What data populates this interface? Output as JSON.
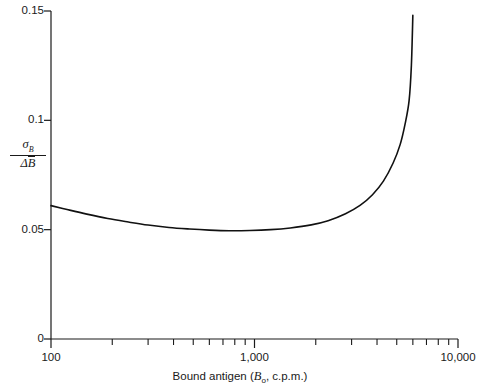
{
  "chart_data": {
    "type": "line",
    "title": "",
    "subtitle": "",
    "xlabel_plain": "Bound antigen (B0, c.p.m.)",
    "xlabel_main": "Bound antigen (",
    "xlabel_italic": "B",
    "xlabel_sub": "o",
    "xlabel_tail": ", c.p.m.)",
    "ylabel_plain": "sigma_B / delta B-bar",
    "ylabel_numerator_symbol": "σ",
    "ylabel_numerator_sub": "B",
    "ylabel_denominator_symbol": "Δ",
    "ylabel_denominator_var": "B",
    "xscale": "log",
    "yscale": "linear",
    "xlim": [
      100,
      10000
    ],
    "ylim": [
      0,
      0.15
    ],
    "grid": false,
    "legend": null,
    "legend_position": "none",
    "xticks_major": [
      {
        "value": 100,
        "label": "100"
      },
      {
        "value": 1000,
        "label": "1,000"
      },
      {
        "value": 10000,
        "label": "10,000"
      }
    ],
    "xticks_minor": [
      200,
      300,
      400,
      500,
      600,
      700,
      800,
      900,
      2000,
      3000,
      4000,
      5000,
      6000,
      7000,
      8000,
      9000
    ],
    "yticks": [
      {
        "value": 0,
        "label": "0"
      },
      {
        "value": 0.05,
        "label": "0.05"
      },
      {
        "value": 0.1,
        "label": "0.1"
      },
      {
        "value": 0.15,
        "label": "0.15"
      }
    ],
    "series": [
      {
        "name": "precision profile",
        "color": "#111111",
        "linewidth": 1.6,
        "x": [
          100,
          120,
          150,
          190,
          240,
          300,
          380,
          480,
          600,
          750,
          950,
          1200,
          1500,
          1900,
          2300,
          2800,
          3300,
          3800,
          4300,
          4800,
          5200,
          5500,
          5750,
          5900,
          6000
        ],
        "y": [
          0.061,
          0.0592,
          0.0571,
          0.0551,
          0.0535,
          0.0521,
          0.051,
          0.0503,
          0.0498,
          0.0495,
          0.0496,
          0.05,
          0.0508,
          0.0522,
          0.0541,
          0.0573,
          0.0611,
          0.066,
          0.0722,
          0.0805,
          0.089,
          0.0985,
          0.109,
          0.125,
          0.148
        ]
      }
    ],
    "notes": {
      "minimum_x": 750,
      "minimum_y": 0.0495,
      "start_y": 0.061,
      "end_x": 6000,
      "end_y": 0.148
    }
  },
  "axes_geometry": {
    "left_px": 51,
    "right_px": 458,
    "top_px": 11,
    "bottom_px": 339
  }
}
